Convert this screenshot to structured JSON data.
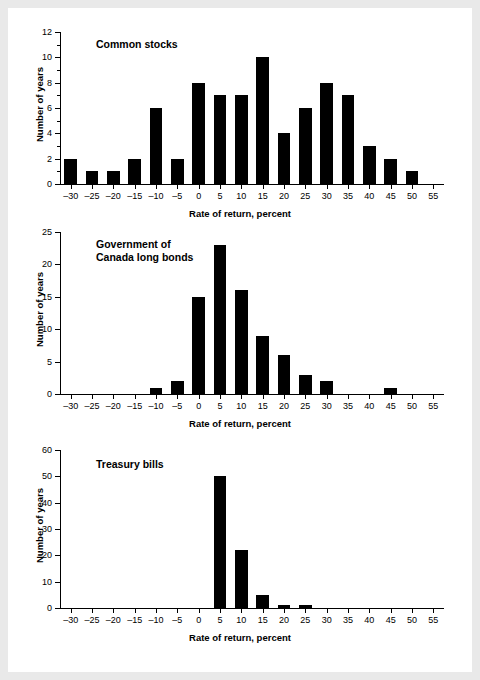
{
  "figure": {
    "background_color": "#e9e9e9",
    "page_color": "#ffffff",
    "bar_color": "#000000",
    "axis_color": "#000000"
  },
  "chart_data": [
    {
      "type": "bar",
      "title": "Common stocks",
      "xlabel": "Rate of return, percent",
      "ylabel": "Number of years",
      "xlim": [
        -32.5,
        57.5
      ],
      "ylim": [
        0,
        12
      ],
      "grid": false,
      "legend": "none",
      "xticks": [
        -30,
        -25,
        -20,
        -15,
        -10,
        -5,
        0,
        5,
        10,
        15,
        20,
        25,
        30,
        35,
        40,
        45,
        50,
        55
      ],
      "xtick_labels": [
        "–30",
        "–25",
        "–20",
        "–15",
        "–10",
        "–5",
        "0",
        "5",
        "10",
        "15",
        "20",
        "25",
        "30",
        "35",
        "40",
        "45",
        "50",
        "55"
      ],
      "yticks": [
        0,
        2,
        4,
        6,
        8,
        10,
        12
      ],
      "ytick_labels": [
        "0",
        "2",
        "4",
        "6",
        "8",
        "10",
        "12"
      ],
      "yminor": [
        1,
        3,
        5,
        7,
        9,
        11
      ],
      "bin_width": 5,
      "bins": [
        {
          "start": -32.5,
          "end": -27.5,
          "value": 2
        },
        {
          "start": -27.5,
          "end": -22.5,
          "value": 1
        },
        {
          "start": -22.5,
          "end": -17.5,
          "value": 1
        },
        {
          "start": -17.5,
          "end": -12.5,
          "value": 2
        },
        {
          "start": -12.5,
          "end": -7.5,
          "value": 6
        },
        {
          "start": -7.5,
          "end": -2.5,
          "value": 2
        },
        {
          "start": -2.5,
          "end": 2.5,
          "value": 8
        },
        {
          "start": 2.5,
          "end": 7.5,
          "value": 7
        },
        {
          "start": 7.5,
          "end": 12.5,
          "value": 7
        },
        {
          "start": 12.5,
          "end": 17.5,
          "value": 10
        },
        {
          "start": 17.5,
          "end": 22.5,
          "value": 4
        },
        {
          "start": 22.5,
          "end": 27.5,
          "value": 6
        },
        {
          "start": 27.5,
          "end": 32.5,
          "value": 8
        },
        {
          "start": 32.5,
          "end": 37.5,
          "value": 7
        },
        {
          "start": 37.5,
          "end": 42.5,
          "value": 3
        },
        {
          "start": 42.5,
          "end": 47.5,
          "value": 2
        },
        {
          "start": 47.5,
          "end": 52.5,
          "value": 1
        },
        {
          "start": 52.5,
          "end": 57.5,
          "value": 0
        }
      ]
    },
    {
      "type": "bar",
      "title": "Government of\nCanada long bonds",
      "xlabel": "Rate of return, percent",
      "ylabel": "Number of years",
      "xlim": [
        -32.5,
        57.5
      ],
      "ylim": [
        0,
        25
      ],
      "grid": false,
      "legend": "none",
      "xticks": [
        -30,
        -25,
        -20,
        -15,
        -10,
        -5,
        0,
        5,
        10,
        15,
        20,
        25,
        30,
        35,
        40,
        45,
        50,
        55
      ],
      "xtick_labels": [
        "–30",
        "–25",
        "–20",
        "–15",
        "–10",
        "–5",
        "0",
        "5",
        "10",
        "15",
        "20",
        "25",
        "30",
        "35",
        "40",
        "45",
        "50",
        "55"
      ],
      "yticks": [
        0,
        5,
        10,
        15,
        20,
        25
      ],
      "ytick_labels": [
        "0",
        "5",
        "10",
        "15",
        "20",
        "25"
      ],
      "yminor": [],
      "bin_width": 5,
      "bins": [
        {
          "start": -32.5,
          "end": -27.5,
          "value": 0
        },
        {
          "start": -27.5,
          "end": -22.5,
          "value": 0
        },
        {
          "start": -22.5,
          "end": -17.5,
          "value": 0
        },
        {
          "start": -17.5,
          "end": -12.5,
          "value": 0
        },
        {
          "start": -12.5,
          "end": -7.5,
          "value": 1
        },
        {
          "start": -7.5,
          "end": -2.5,
          "value": 2
        },
        {
          "start": -2.5,
          "end": 2.5,
          "value": 15
        },
        {
          "start": 2.5,
          "end": 7.5,
          "value": 23
        },
        {
          "start": 7.5,
          "end": 12.5,
          "value": 16
        },
        {
          "start": 12.5,
          "end": 17.5,
          "value": 9
        },
        {
          "start": 17.5,
          "end": 22.5,
          "value": 6
        },
        {
          "start": 22.5,
          "end": 27.5,
          "value": 3
        },
        {
          "start": 27.5,
          "end": 32.5,
          "value": 2
        },
        {
          "start": 32.5,
          "end": 37.5,
          "value": 0
        },
        {
          "start": 37.5,
          "end": 42.5,
          "value": 0
        },
        {
          "start": 42.5,
          "end": 47.5,
          "value": 1
        },
        {
          "start": 47.5,
          "end": 52.5,
          "value": 0
        },
        {
          "start": 52.5,
          "end": 57.5,
          "value": 0
        }
      ]
    },
    {
      "type": "bar",
      "title": "Treasury bills",
      "xlabel": "Rate of return, percent",
      "ylabel": "Number of years",
      "xlim": [
        -32.5,
        57.5
      ],
      "ylim": [
        0,
        60
      ],
      "grid": false,
      "legend": "none",
      "xticks": [
        -30,
        -25,
        -20,
        -15,
        -10,
        -5,
        0,
        5,
        10,
        15,
        20,
        25,
        30,
        35,
        40,
        45,
        50,
        55
      ],
      "xtick_labels": [
        "–30",
        "–25",
        "–20",
        "–15",
        "–10",
        "–5",
        "0",
        "5",
        "10",
        "15",
        "20",
        "25",
        "30",
        "35",
        "40",
        "45",
        "50",
        "55"
      ],
      "yticks": [
        0,
        10,
        20,
        30,
        40,
        50,
        60
      ],
      "ytick_labels": [
        "0",
        "10",
        "20",
        "30",
        "40",
        "50",
        "60"
      ],
      "yminor": [],
      "bin_width": 5,
      "bins": [
        {
          "start": -32.5,
          "end": -27.5,
          "value": 0
        },
        {
          "start": -27.5,
          "end": -22.5,
          "value": 0
        },
        {
          "start": -22.5,
          "end": -17.5,
          "value": 0
        },
        {
          "start": -17.5,
          "end": -12.5,
          "value": 0
        },
        {
          "start": -12.5,
          "end": -7.5,
          "value": 0
        },
        {
          "start": -7.5,
          "end": -2.5,
          "value": 0
        },
        {
          "start": -2.5,
          "end": 2.5,
          "value": 0
        },
        {
          "start": 2.5,
          "end": 7.5,
          "value": 50
        },
        {
          "start": 7.5,
          "end": 12.5,
          "value": 22
        },
        {
          "start": 12.5,
          "end": 17.5,
          "value": 5
        },
        {
          "start": 17.5,
          "end": 22.5,
          "value": 1
        },
        {
          "start": 22.5,
          "end": 27.5,
          "value": 1
        },
        {
          "start": 27.5,
          "end": 32.5,
          "value": 0
        },
        {
          "start": 32.5,
          "end": 37.5,
          "value": 0
        },
        {
          "start": 37.5,
          "end": 42.5,
          "value": 0
        },
        {
          "start": 42.5,
          "end": 47.5,
          "value": 0
        },
        {
          "start": 47.5,
          "end": 52.5,
          "value": 0
        },
        {
          "start": 52.5,
          "end": 57.5,
          "value": 0
        }
      ]
    }
  ]
}
